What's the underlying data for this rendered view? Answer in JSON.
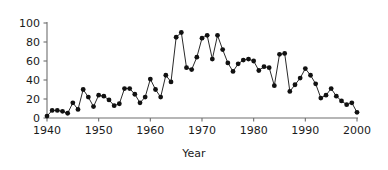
{
  "chart_data": {
    "type": "line",
    "title": "",
    "subtitle": "",
    "xlabel": "Year",
    "ylabel": "",
    "xlim": [
      1940,
      2000
    ],
    "ylim": [
      0,
      100
    ],
    "xticks": [
      1940,
      1950,
      1960,
      1970,
      1980,
      1990,
      2000
    ],
    "xtick_labels": [
      "1940",
      "1950",
      "1960",
      "1970",
      "1980",
      "1990",
      "2000"
    ],
    "yticks": [
      0,
      20,
      40,
      60,
      80,
      100
    ],
    "ytick_labels": [
      "0",
      "20",
      "40",
      "60",
      "80",
      "100"
    ],
    "grid": false,
    "legend": null,
    "markers": "filled-circle",
    "line_color": "#2a2a2a",
    "marker_color": "#111111",
    "axis_color": "#6e6e6e",
    "background_color": "#ffffff",
    "x": [
      1940,
      1941,
      1942,
      1943,
      1944,
      1945,
      1946,
      1947,
      1948,
      1949,
      1950,
      1951,
      1952,
      1953,
      1954,
      1955,
      1956,
      1957,
      1958,
      1959,
      1960,
      1961,
      1962,
      1963,
      1964,
      1965,
      1966,
      1967,
      1968,
      1969,
      1970,
      1971,
      1972,
      1973,
      1974,
      1975,
      1976,
      1977,
      1978,
      1979,
      1980,
      1981,
      1982,
      1983,
      1984,
      1985,
      1986,
      1987,
      1988,
      1989,
      1990,
      1991,
      1992,
      1993,
      1994,
      1995,
      1996,
      1997,
      1998,
      1999,
      2000
    ],
    "values": [
      2,
      8,
      8,
      7,
      5,
      16,
      9,
      30,
      22,
      12,
      24,
      23,
      19,
      13,
      15,
      31,
      31,
      25,
      16,
      22,
      41,
      30,
      22,
      45,
      38,
      85,
      90,
      53,
      51,
      64,
      84,
      87,
      62,
      87,
      72,
      58,
      49,
      57,
      61,
      62,
      60,
      50,
      54,
      53,
      34,
      67,
      68,
      28,
      35,
      42,
      52,
      45,
      36,
      21,
      24,
      31,
      23,
      18,
      14,
      16,
      6
    ],
    "series": [
      {
        "name": "series-1",
        "values": [
          2,
          8,
          8,
          7,
          5,
          16,
          9,
          30,
          22,
          12,
          24,
          23,
          19,
          13,
          15,
          31,
          31,
          25,
          16,
          22,
          41,
          30,
          22,
          45,
          38,
          85,
          90,
          53,
          51,
          64,
          84,
          87,
          62,
          87,
          72,
          58,
          49,
          57,
          61,
          62,
          60,
          50,
          54,
          53,
          34,
          67,
          68,
          28,
          35,
          42,
          52,
          45,
          36,
          21,
          24,
          31,
          23,
          18,
          14,
          16,
          6
        ]
      }
    ]
  }
}
